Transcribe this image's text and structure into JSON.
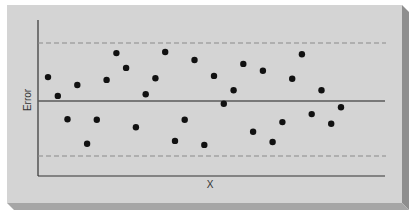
{
  "chart_data": {
    "type": "scatter",
    "title": "",
    "xlabel": "X",
    "ylabel": "Error",
    "grid": false,
    "legend": null,
    "ylim": [
      -1.0,
      1.0
    ],
    "xlim": [
      0,
      34
    ],
    "reference_lines": [
      {
        "name": "zero-line",
        "y": 0,
        "style": "solid"
      },
      {
        "name": "upper-limit",
        "y": 1.0,
        "style": "dashed"
      },
      {
        "name": "lower-limit",
        "y": -0.97,
        "style": "dashed"
      }
    ],
    "x": [
      1,
      2,
      3,
      4,
      5,
      6,
      7,
      8,
      9,
      10,
      11,
      12,
      13,
      14,
      15,
      16,
      17,
      18,
      19,
      20,
      21,
      22,
      23,
      24,
      25,
      26,
      27,
      28,
      29,
      30,
      31
    ],
    "y": [
      0.42,
      0.09,
      -0.32,
      0.28,
      -0.75,
      -0.33,
      0.37,
      0.84,
      0.58,
      -0.46,
      0.12,
      0.4,
      0.86,
      -0.7,
      -0.33,
      0.72,
      -0.77,
      0.44,
      -0.05,
      0.19,
      0.65,
      -0.54,
      0.53,
      -0.72,
      -0.37,
      0.39,
      0.82,
      -0.23,
      0.19,
      -0.4,
      -0.11
    ]
  },
  "colors": {
    "background": "#ffffff",
    "panel": "#d4d4d4",
    "panel_edge_right": "#8e8e8e",
    "panel_edge_bottom": "#a6a6a6",
    "axis": "#333333",
    "dashed": "#8a8a8a",
    "center_line": "#5a5a5a",
    "points": "#111111"
  },
  "labels": {
    "x_axis": "X",
    "y_axis": "Error"
  }
}
